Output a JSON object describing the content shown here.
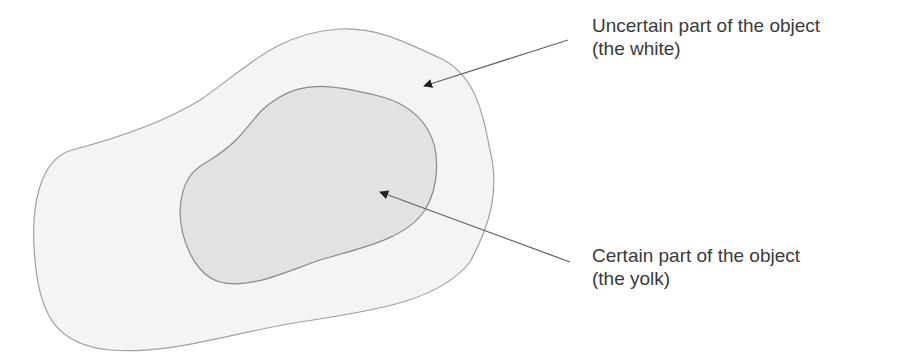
{
  "diagram": {
    "type": "region-with-uncertainty",
    "regions": [
      {
        "id": "outer",
        "name": "uncertain-region",
        "fill": "#f4f4f4",
        "stroke": "#9a9a9a"
      },
      {
        "id": "inner",
        "name": "certain-region",
        "fill": "#e3e3e3",
        "stroke": "#8a8a8a"
      }
    ],
    "labels": {
      "uncertain": {
        "line1": "Uncertain part of the object",
        "line2": "(the white)"
      },
      "certain": {
        "line1": "Certain part of the object",
        "line2": "(the yolk)"
      }
    },
    "arrow_color": "#222222",
    "line_color": "#666666"
  }
}
